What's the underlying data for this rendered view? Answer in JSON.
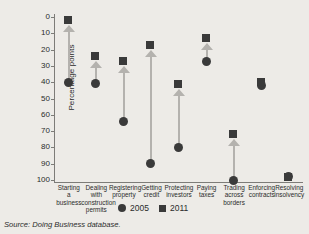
{
  "chart_data": {
    "type": "scatter",
    "title": "",
    "xlabel": "",
    "ylabel": "Percentage points",
    "ylim": [
      0,
      100
    ],
    "y_inverted": true,
    "yticks": [
      0,
      10,
      20,
      30,
      40,
      50,
      60,
      70,
      80,
      90,
      100
    ],
    "ytick_labels": [
      "0",
      "10",
      "20",
      "30",
      "40",
      "50",
      "60",
      "70",
      "80",
      "90",
      "100"
    ],
    "grid": false,
    "legend_position": "bottom-center",
    "categories": [
      "Starting a business",
      "Dealing with construction permits",
      "Registering property",
      "Getting credit",
      "Protecting investors",
      "Paying taxes",
      "Trading across borders",
      "Enforcing contracts",
      "Resolving insolvency"
    ],
    "category_lines": [
      [
        "Starting",
        "a",
        "business"
      ],
      [
        "Dealing",
        "with",
        "construction",
        "permits"
      ],
      [
        "Registering",
        "property"
      ],
      [
        "Getting",
        "credit"
      ],
      [
        "Protecting",
        "investors"
      ],
      [
        "Paying",
        "taxes"
      ],
      [
        "Trading",
        "across",
        "borders"
      ],
      [
        "Enforcing",
        "contracts"
      ],
      [
        "Resolving",
        "insolvency"
      ]
    ],
    "series": [
      {
        "name": "2005",
        "marker": "circle",
        "color": "#3a3a3a",
        "values": [
          40,
          41,
          64,
          90,
          80,
          27,
          100,
          42,
          98
        ]
      },
      {
        "name": "2011",
        "marker": "square",
        "color": "#3a3a3a",
        "values": [
          2,
          24,
          27,
          17,
          41,
          13,
          72,
          40,
          98
        ]
      }
    ],
    "arrows": [
      {
        "category": "Starting a business",
        "from": 40,
        "to": 2
      },
      {
        "category": "Dealing with construction permits",
        "from": 41,
        "to": 24
      },
      {
        "category": "Registering property",
        "from": 64,
        "to": 27
      },
      {
        "category": "Getting credit",
        "from": 90,
        "to": 17
      },
      {
        "category": "Protecting investors",
        "from": 80,
        "to": 41
      },
      {
        "category": "Paying taxes",
        "from": 27,
        "to": 13
      },
      {
        "category": "Trading across borders",
        "from": 100,
        "to": 72
      }
    ],
    "arrow_color": "#b4b2ae"
  },
  "legend": {
    "items": [
      {
        "label": "2005",
        "marker": "circle"
      },
      {
        "label": "2011",
        "marker": "square"
      }
    ]
  },
  "footer": {
    "source_prefix": "Source: ",
    "source_work": "Doing Business",
    "source_suffix": " database."
  },
  "colors": {
    "background": "#edebe7",
    "marker": "#3a3a3a",
    "arrow": "#b4b2ae",
    "axis": "#7d7c78",
    "text": "#2b2b2b"
  }
}
